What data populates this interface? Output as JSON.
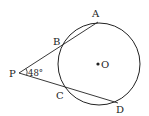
{
  "diagram": {
    "type": "geometry",
    "circle": {
      "center_label": "O",
      "cx": 99,
      "cy": 64,
      "r": 41
    },
    "points": {
      "P": {
        "label": "P",
        "x": 19,
        "y": 73
      },
      "A": {
        "label": "A",
        "x": 98,
        "y": 22
      },
      "B": {
        "label": "B",
        "x": 63,
        "y": 44
      },
      "C": {
        "label": "C",
        "x": 66,
        "y": 88
      },
      "D": {
        "label": "D",
        "x": 118,
        "y": 103
      }
    },
    "segments": [
      [
        "P",
        "A"
      ],
      [
        "P",
        "D"
      ]
    ],
    "angle": {
      "vertex": "P",
      "label": "48°",
      "value_degrees": 48
    }
  }
}
